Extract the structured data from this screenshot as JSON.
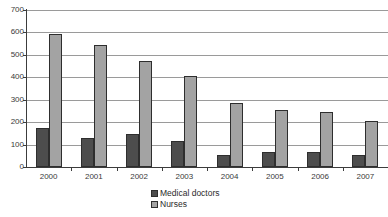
{
  "chart_data": {
    "type": "bar",
    "title": "",
    "subtitle": "",
    "xlabel": "",
    "ylabel": "",
    "categories": [
      "2000",
      "2001",
      "2002",
      "2003",
      "2004",
      "2005",
      "2006",
      "2007"
    ],
    "series": [
      {
        "name": "Medical doctors",
        "color": "#4d4d4d",
        "values": [
          175,
          131,
          147,
          114,
          53,
          69,
          66,
          52
        ]
      },
      {
        "name": "Nurses",
        "color": "#a3a3a3",
        "values": [
          592,
          542,
          471,
          404,
          285,
          255,
          247,
          207
        ]
      }
    ],
    "ylim": [
      0,
      700
    ],
    "ytick_values": [
      0,
      100,
      200,
      300,
      400,
      500,
      600,
      700
    ],
    "ytick_labels": [
      "0",
      "100",
      "200",
      "300",
      "400",
      "500",
      "600",
      "700"
    ],
    "grid": true,
    "grid_axis": "y",
    "legend_position": "bottom",
    "legend_entries": [
      "Medical doctors",
      "Nurses"
    ],
    "axis_color": "#3c3c3c",
    "gridline_color": "#9a9a9a",
    "background_color": "#ffffff"
  }
}
